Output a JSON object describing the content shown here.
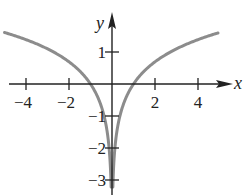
{
  "chart_data": {
    "type": "line",
    "title": "",
    "function": "y = ln|x|",
    "xlabel": "x",
    "ylabel": "y",
    "xlim": [
      -5,
      5.2
    ],
    "ylim": [
      -3.4,
      2
    ],
    "grid": false,
    "legend": null,
    "x_ticks": [
      {
        "value": -4,
        "label": "−4"
      },
      {
        "value": -2,
        "label": "−2"
      },
      {
        "value": 2,
        "label": "2"
      },
      {
        "value": 4,
        "label": "4"
      }
    ],
    "y_ticks": [
      {
        "value": 1,
        "label": "1"
      },
      {
        "value": -1,
        "label": "−1"
      },
      {
        "value": -2,
        "label": "−2"
      },
      {
        "value": -3,
        "label": "−3"
      }
    ],
    "series": [
      {
        "name": "ln|x| (x<0 branch)",
        "x": [
          -5,
          -4,
          -3,
          -2,
          -1.5,
          -1,
          -0.75,
          -0.5,
          -0.35,
          -0.25,
          -0.15,
          -0.1,
          -0.06,
          -0.04
        ],
        "values": [
          1.609,
          1.386,
          1.099,
          0.693,
          0.405,
          0,
          -0.288,
          -0.693,
          -1.05,
          -1.386,
          -1.897,
          -2.303,
          -2.813,
          -3.219
        ]
      },
      {
        "name": "ln|x| (x>0 branch)",
        "x": [
          0.04,
          0.06,
          0.1,
          0.15,
          0.25,
          0.35,
          0.5,
          0.75,
          1,
          1.5,
          2,
          3,
          4,
          4.93
        ],
        "values": [
          -3.219,
          -2.813,
          -2.303,
          -1.897,
          -1.386,
          -1.05,
          -0.693,
          -0.288,
          0,
          0.405,
          0.693,
          1.099,
          1.386,
          1.595
        ]
      }
    ],
    "colors": {
      "curve": "#8c8c8c",
      "axes": "#222222"
    }
  },
  "layout": {
    "origin_px": [
      112,
      84
    ],
    "x_scale_px": 21.5,
    "y_scale_px": 32
  }
}
